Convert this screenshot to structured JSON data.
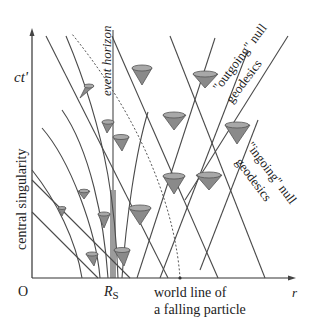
{
  "diagram": {
    "type": "spacetime diagram",
    "labels": {
      "vertical_axis": "ct'",
      "horizontal_axis": "r",
      "origin": "O",
      "schwarzschild_radius": "R",
      "schwarzschild_radius_sub": "S",
      "central_singularity": "central singularity",
      "event_horizon": "event horizon",
      "outgoing_line1": "\"outgoing\" null",
      "outgoing_line2": "geodesics",
      "ingoing_line1": "\"ingoing\" null",
      "ingoing_line2": "geodesics",
      "worldline_line1": "world line of",
      "worldline_line2": "a falling particle"
    },
    "colors": {
      "lines": "#4a4a4a",
      "cone_fill": "#8a8a8a",
      "text": "#222222"
    }
  }
}
